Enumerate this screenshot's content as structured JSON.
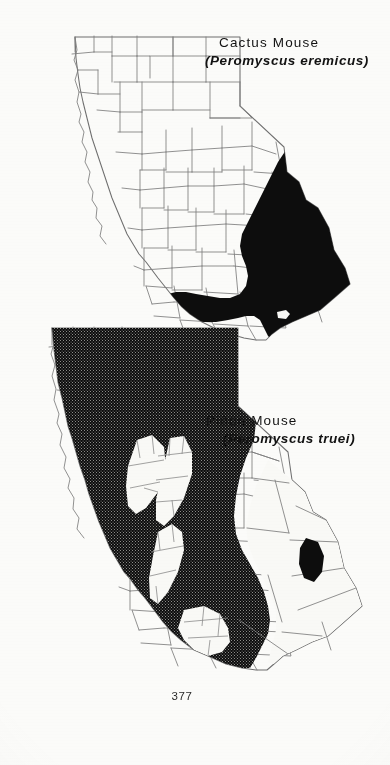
{
  "page": {
    "folio": "377",
    "background_color": "#fbfbf9",
    "ink_color": "#121212",
    "county_line_color": "#7d7d7d",
    "coast_line_color": "#9a9a9a",
    "range_fill_color": "#0d0d0d"
  },
  "figures": [
    {
      "id": "cactus-mouse-map",
      "subject": "California county outline map",
      "caption": {
        "common_name": "Cactus Mouse",
        "scientific_name": "Peromyscus eremicus",
        "scientific_name_display": "(Peromyscus eremicus)",
        "open_paren": "(",
        "close_paren": ")"
      },
      "range": {
        "fill_style": "solid-black",
        "description": "Southeastern desert region of California",
        "inclusion_hole_label": "Salton Sea"
      }
    },
    {
      "id": "pinon-mouse-map",
      "subject": "California county outline map",
      "caption": {
        "common_name": "Piñon Mouse",
        "scientific_name": "Peromyscus truei",
        "scientific_name_display": "(Peromyscus truei)",
        "open_paren": "(",
        "close_paren": ")"
      },
      "range": {
        "fill_style": "stipple-black",
        "description": "Most of California except the Central Valley and southeastern deserts",
        "inclusion_hole_label": "Central Valley",
        "outlier_patch_label": "eastern desert outlier"
      }
    }
  ]
}
